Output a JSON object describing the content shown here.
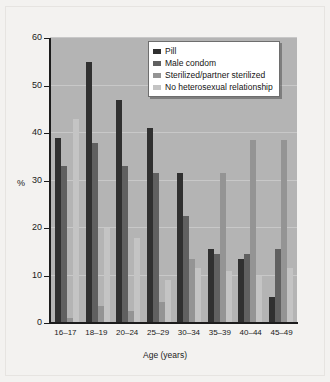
{
  "chart_data": {
    "type": "bar",
    "title": "",
    "subtitle": "",
    "xlabel": "Age (years)",
    "ylabel": "%",
    "ylim": [
      0,
      60
    ],
    "yticks": [
      0,
      10,
      20,
      30,
      40,
      50,
      60
    ],
    "grid": true,
    "legend_position": "top-right",
    "categories": [
      "16–17",
      "18–19",
      "20–24",
      "25–29",
      "30–34",
      "35–39",
      "40–44",
      "45–49"
    ],
    "series": [
      {
        "name": "Pill",
        "color": "#303030",
        "values": [
          39,
          55,
          47,
          41,
          31.5,
          15.5,
          13.5,
          5.5
        ]
      },
      {
        "name": "Male condom",
        "color": "#606060",
        "values": [
          33,
          38,
          33,
          31.5,
          22.5,
          14.5,
          14.5,
          15.5
        ]
      },
      {
        "name": "Sterilized/partner sterilized",
        "color": "#949494",
        "values": [
          1,
          3.5,
          2.5,
          4.5,
          13.5,
          31.5,
          38.5,
          38.5
        ]
      },
      {
        "name": "No heterosexual relationship",
        "color": "#c4c4c4",
        "values": [
          43,
          20,
          18,
          9,
          11.5,
          11,
          10,
          11.5
        ]
      }
    ]
  },
  "style": {
    "figure_background": "#f3f2f0",
    "plot_background": "#b4b4b4",
    "gridline_color": "#c8c8c8",
    "axis_color": "#1c1c1c",
    "legend_background": "#ffffff",
    "legend_border": "#6e6e6e"
  }
}
